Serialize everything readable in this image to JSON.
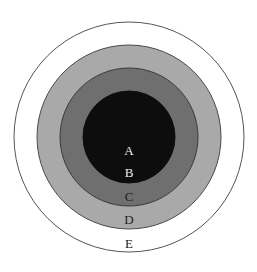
{
  "diagram": {
    "type": "concentric-circles",
    "center": {
      "x": 129,
      "y": 137
    },
    "rings": [
      {
        "id": "E",
        "label": "E",
        "radius": 115,
        "fill": "#ffffff",
        "stroke": "#555555",
        "label_color": "#222222",
        "label_y": 248
      },
      {
        "id": "D",
        "label": "D",
        "radius": 92,
        "fill": "#a9a9a9",
        "stroke": "#4a4a4a",
        "label_color": "#222222",
        "label_y": 224
      },
      {
        "id": "C",
        "label": "C",
        "radius": 69,
        "fill": "#6f6f6f",
        "stroke": "#3a3a3a",
        "label_color": "#1e1e1e",
        "label_y": 201
      },
      {
        "id": "B",
        "label": "B",
        "radius": 46,
        "fill": "#0d0d0d",
        "stroke": "#0d0d0d",
        "label_color": "#eeeeee",
        "label_y": 177
      },
      {
        "id": "A",
        "label": "A",
        "radius": 46,
        "fill": "#0d0d0d",
        "stroke": "#0d0d0d",
        "label_color": "#eeeeee",
        "label_y": 155
      }
    ]
  }
}
